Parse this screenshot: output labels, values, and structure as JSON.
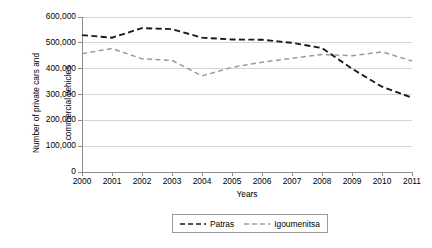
{
  "chart_data": {
    "type": "line",
    "title": "",
    "xlabel": "Years",
    "ylabel": "Number of private cars and commercial vehicles",
    "ylabel_line1": "Number of private cars and",
    "ylabel_line2": "commercial vehicles",
    "categories": [
      "2000",
      "2001",
      "2002",
      "2003",
      "2004",
      "2005",
      "2006",
      "2007",
      "2008",
      "2009",
      "2010",
      "2011"
    ],
    "x": [
      2000,
      2001,
      2002,
      2003,
      2004,
      2005,
      2006,
      2007,
      2008,
      2009,
      2010,
      2011
    ],
    "ylim": [
      0,
      600000
    ],
    "ytick_labels": [
      "600,000",
      "500,000",
      "400,000",
      "300,000",
      "200,000",
      "100,000",
      "0"
    ],
    "ytick_values": [
      600000,
      500000,
      400000,
      300000,
      200000,
      100000,
      0
    ],
    "grid": "horizontal",
    "legend_position": "bottom",
    "series": [
      {
        "name": "Patras",
        "color": "#1a1a1a",
        "style": "dashed",
        "values": [
          530000,
          520000,
          557000,
          553000,
          520000,
          513000,
          512000,
          500000,
          480000,
          400000,
          330000,
          288000
        ]
      },
      {
        "name": "Igoumenitsa",
        "color": "#9b9b9b",
        "style": "dashed",
        "values": [
          458000,
          478000,
          438000,
          432000,
          372000,
          405000,
          425000,
          440000,
          455000,
          450000,
          465000,
          430000
        ]
      }
    ]
  },
  "legend": {
    "items": [
      {
        "label": "Patras"
      },
      {
        "label": "Igoumenitsa"
      }
    ]
  },
  "axes": {
    "x_title": "Years",
    "y_title_line1": "Number of private cars and",
    "y_title_line2": "commercial vehicles"
  },
  "colors": {
    "series_patras": "#1a1a1a",
    "series_igoumenitsa": "#9b9b9b",
    "gridline": "#d4d4d4",
    "axis": "#8d8d8d",
    "text": "#000000",
    "background": "#ffffff"
  }
}
